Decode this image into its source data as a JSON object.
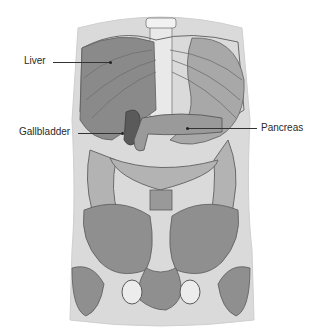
{
  "figure": {
    "colors": {
      "body_silhouette": "#d9d9d9",
      "organ_dark": "#7a7a7a",
      "organ_mid": "#9c9c9c",
      "organ_light": "#bdbdbd",
      "bone": "#8f8f8f",
      "outline": "#5e5e5e"
    }
  },
  "labels": [
    {
      "id": "liver",
      "text": "Liver"
    },
    {
      "id": "gallbladder",
      "text": "Gallbladder"
    },
    {
      "id": "pancreas",
      "text": "Pancreas"
    }
  ]
}
